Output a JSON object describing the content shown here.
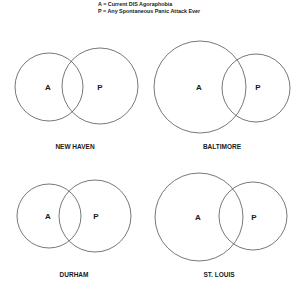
{
  "legend": {
    "line_a": "A = Current DIS Agoraphobia",
    "line_p": "P = Any Spontaneous Panic Attack Ever"
  },
  "panels": [
    {
      "name": "NEW HAVEN",
      "a_label": "A",
      "p_label": "P",
      "a": {
        "cx": 49,
        "cy": 87,
        "r": 34
      },
      "p": {
        "cx": 100,
        "cy": 86,
        "r": 38
      }
    },
    {
      "name": "BALTIMORE",
      "a_label": "A",
      "p_label": "P",
      "a": {
        "cx": 200,
        "cy": 87,
        "r": 46
      },
      "p": {
        "cx": 256,
        "cy": 88,
        "r": 34
      }
    },
    {
      "name": "DURHAM",
      "a_label": "A",
      "p_label": "P",
      "a": {
        "cx": 49,
        "cy": 216,
        "r": 32
      },
      "p": {
        "cx": 95,
        "cy": 216,
        "r": 36
      }
    },
    {
      "name": "ST. LOUIS",
      "a_label": "A",
      "p_label": "P",
      "a": {
        "cx": 199,
        "cy": 217,
        "r": 44
      },
      "p": {
        "cx": 253,
        "cy": 216,
        "r": 34
      }
    }
  ],
  "colors": {
    "stroke": "#555555",
    "text": "#1a1a1a",
    "background": "#ffffff"
  }
}
